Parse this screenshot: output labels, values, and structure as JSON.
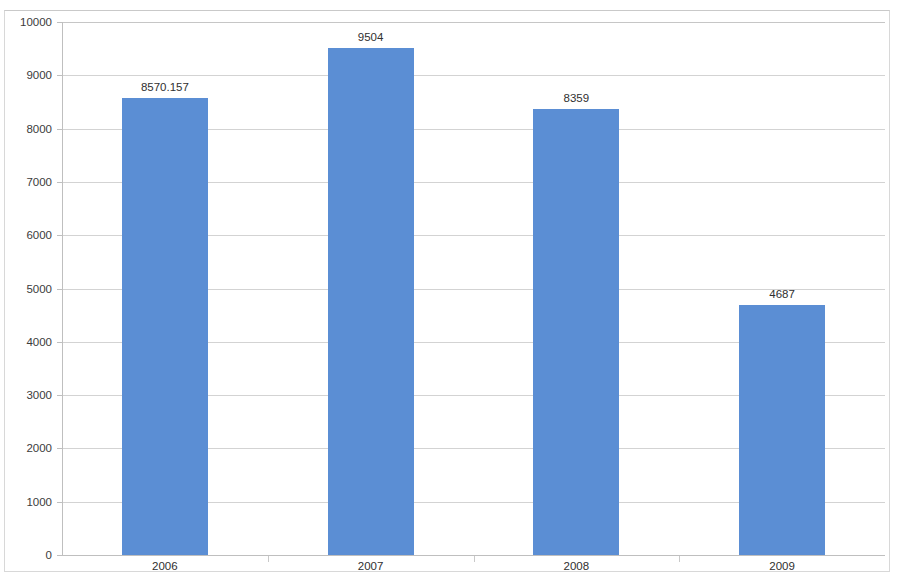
{
  "chart_data": {
    "type": "bar",
    "title": "",
    "xlabel": "",
    "ylabel": "",
    "categories": [
      "2006",
      "2007",
      "2008",
      "2009"
    ],
    "values": [
      8570.157,
      9504,
      8359,
      4687
    ],
    "data_labels": [
      "8570.157",
      "9504",
      "8359",
      "4687"
    ],
    "series": [
      {
        "name": "",
        "values": [
          8570.157,
          9504,
          8359,
          4687
        ]
      }
    ],
    "ylim": [
      0,
      10000
    ],
    "ytick_values": [
      0,
      1000,
      2000,
      3000,
      4000,
      5000,
      6000,
      7000,
      8000,
      9000,
      10000
    ],
    "ytick_labels": [
      "0",
      "1000",
      "2000",
      "3000",
      "4000",
      "5000",
      "6000",
      "7000",
      "8000",
      "9000",
      "10000"
    ],
    "grid": true,
    "grid_axis": "y",
    "legend": false,
    "legend_position": "none",
    "bar_color": "#5B8ED4",
    "gridline_color": "#D3D3D3",
    "axis_color": "#BFBFBF",
    "text_color": "#303030",
    "background_color": "#FFFFFF"
  }
}
